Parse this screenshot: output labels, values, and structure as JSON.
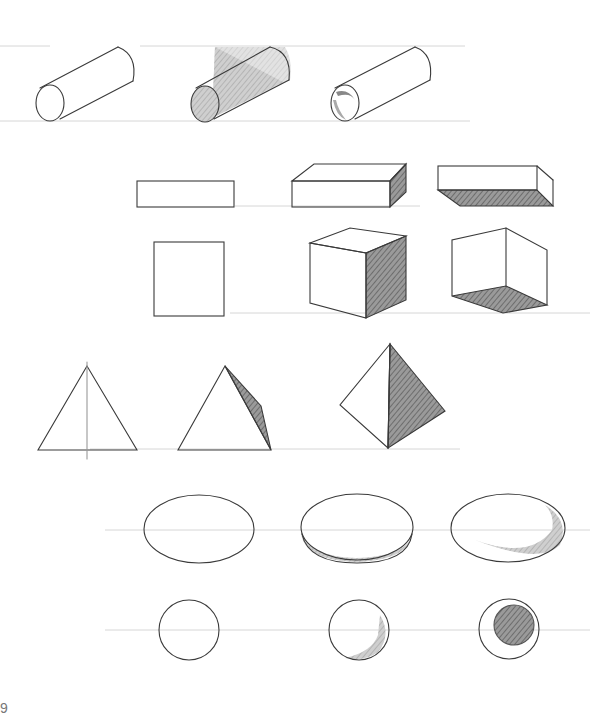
{
  "drawing": {
    "subject": "Pencil sketch exercise of basic geometric forms with shading",
    "stroke_color": "#3a3a3a",
    "guide_color": "#d4d4d4",
    "shade_color": "#6a6a6a",
    "rows": [
      {
        "name": "cylinders",
        "items": [
          "outline cylinder",
          "cylinder with shaded end and side",
          "hollow tube with shaded interior"
        ]
      },
      {
        "name": "boxes",
        "items": [
          "flat rectangle",
          "box with shaded right side",
          "box viewed from below with shaded bottom"
        ]
      },
      {
        "name": "cubes",
        "items": [
          "square",
          "cube with shaded right face",
          "open cube with shaded floor"
        ]
      },
      {
        "name": "triangles",
        "items": [
          "triangle with center guide",
          "triangle with shaded edge face",
          "tetrahedron with shaded face"
        ]
      },
      {
        "name": "ellipses",
        "items": [
          "outline ellipse",
          "disc with shaded rim",
          "concave dish with crescent shading"
        ]
      },
      {
        "name": "circles",
        "items": [
          "outline circle",
          "circle with crescent shade",
          "ring with shaded inner disc"
        ]
      }
    ]
  },
  "page": {
    "number": "9"
  }
}
